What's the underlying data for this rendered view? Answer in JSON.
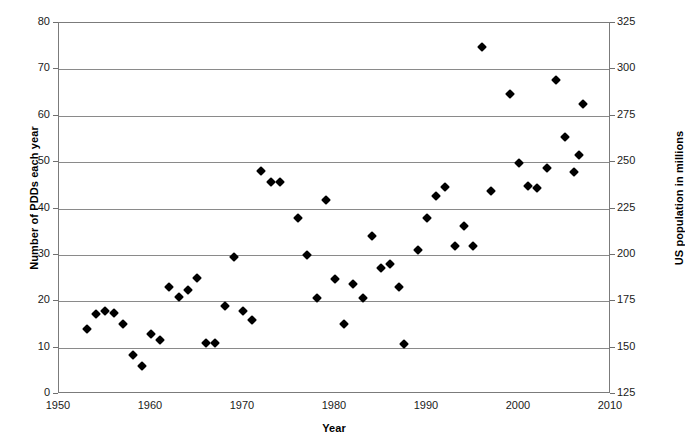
{
  "chart_data": {
    "type": "scatter",
    "title": "",
    "xlabel": "Year",
    "ylabel": "Number of PDDs each year",
    "y2label": "US population in millions",
    "xlim": [
      1950,
      2010
    ],
    "ylim": [
      0,
      80
    ],
    "y2lim": [
      125,
      325
    ],
    "xticks": [
      1950,
      1960,
      1970,
      1980,
      1990,
      2000,
      2010
    ],
    "yticks": [
      0,
      10,
      20,
      30,
      40,
      50,
      60,
      70,
      80
    ],
    "y2ticks": [
      125,
      150,
      175,
      200,
      225,
      250,
      275,
      300,
      325
    ],
    "grid": "horizontal",
    "legend": "none",
    "marker": "filled-diamond",
    "marker_color": "#000000",
    "series": [
      {
        "name": "PDDs each year",
        "points": [
          [
            1953,
            14
          ],
          [
            1954,
            17.3
          ],
          [
            1955,
            18
          ],
          [
            1956,
            17.5
          ],
          [
            1957,
            15
          ],
          [
            1958,
            8.5
          ],
          [
            1959,
            6
          ],
          [
            1960,
            13
          ],
          [
            1961,
            11.7
          ],
          [
            1962,
            23
          ],
          [
            1963,
            21
          ],
          [
            1964,
            22.5
          ],
          [
            1965,
            25
          ],
          [
            1966,
            11
          ],
          [
            1967,
            11
          ],
          [
            1968,
            19
          ],
          [
            1969,
            29.5
          ],
          [
            1970,
            18
          ],
          [
            1971,
            16
          ],
          [
            1972,
            48
          ],
          [
            1973,
            45.8
          ],
          [
            1974,
            45.8
          ],
          [
            1976,
            38
          ],
          [
            1977,
            30
          ],
          [
            1978,
            20.8
          ],
          [
            1979,
            41.8
          ],
          [
            1980,
            24.8
          ],
          [
            1981,
            15
          ],
          [
            1982,
            23.8
          ],
          [
            1983,
            20.8
          ],
          [
            1984,
            34
          ],
          [
            1985,
            27.2
          ],
          [
            1986,
            28
          ],
          [
            1987,
            23
          ],
          [
            1987.5,
            10.7
          ],
          [
            1989,
            31
          ],
          [
            1990,
            38
          ],
          [
            1991,
            42.8
          ],
          [
            1992,
            44.7
          ],
          [
            1993,
            32
          ],
          [
            1994,
            36.2
          ],
          [
            1995,
            32
          ],
          [
            1996,
            74.8
          ],
          [
            1997,
            43.8
          ],
          [
            1999,
            64.7
          ],
          [
            2000,
            49.8
          ],
          [
            2001,
            44.8
          ],
          [
            2002,
            44.5
          ],
          [
            2003,
            48.7
          ],
          [
            2004,
            67.8
          ],
          [
            2005,
            55.5
          ],
          [
            2006,
            47.8
          ],
          [
            2006.5,
            51.5
          ],
          [
            2007,
            62.5
          ]
        ]
      }
    ]
  }
}
